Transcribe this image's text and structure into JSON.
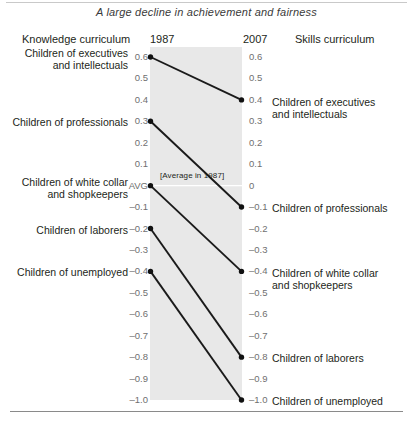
{
  "figure": {
    "title": "A large decline in achievement and fairness",
    "header": {
      "left_column": "Knowledge curriculum",
      "start_year": "1987",
      "end_year": "2007",
      "right_column": "Skills curriculum"
    },
    "annotation": "[Average in 1987]",
    "avg_tick_label": "AVG",
    "band_color": "#e8e8e8",
    "line_color": "#1a1a1a"
  },
  "axis": {
    "left_ticks": [
      "0.6",
      "0.5",
      "0.4",
      "0.3",
      "0.2",
      "0.1",
      "AVG",
      "–0.1",
      "–0.2",
      "–0.3",
      "–0.4",
      "–0.5",
      "–0.6",
      "–0.7",
      "–0.8",
      "–0.9",
      "–1.0"
    ],
    "right_ticks": [
      "0.6",
      "0.5",
      "0.4",
      "0.3",
      "0.2",
      "0.1",
      "0",
      "–0.1",
      "–0.2",
      "–0.3",
      "–0.4",
      "–0.5",
      "–0.6",
      "–0.7",
      "–0.8",
      "–0.9",
      "–1.0"
    ],
    "tick_values": [
      0.6,
      0.5,
      0.4,
      0.3,
      0.2,
      0.1,
      0,
      -0.1,
      -0.2,
      -0.3,
      -0.4,
      -0.5,
      -0.6,
      -0.7,
      -0.8,
      -0.9,
      -1.0
    ]
  },
  "chart_data": {
    "type": "line",
    "title": "A large decline in achievement and fairness",
    "xlabel": "",
    "ylabel": "",
    "x": [
      "1987",
      "2007"
    ],
    "ylim": [
      -1.0,
      0.6
    ],
    "grid": false,
    "legend": "inline-endpoint-labels",
    "series": [
      {
        "name": "Children of executives and intellectuals",
        "values": [
          0.6,
          0.4
        ],
        "start_label": "0.6",
        "end_label": "0.4"
      },
      {
        "name": "Children of professionals",
        "values": [
          0.3,
          -0.1
        ],
        "start_label": "0.3",
        "end_label": "–0.1"
      },
      {
        "name": "Children of white collar and shopkeepers",
        "values": [
          0.0,
          -0.4
        ],
        "start_label": "AVG",
        "end_label": "–0.4"
      },
      {
        "name": "Children of laborers",
        "values": [
          -0.2,
          -0.8
        ],
        "start_label": "–0.2",
        "end_label": "–0.8"
      },
      {
        "name": "Children of unemployed",
        "values": [
          -0.4,
          -1.0
        ],
        "start_label": "–0.4",
        "end_label": "–1.0"
      }
    ],
    "annotations": [
      {
        "text": "[Average in 1987]",
        "at_value": 0.0,
        "at_x": "1987"
      }
    ]
  },
  "left_labels": [
    {
      "line1": "Children of executives",
      "line2": "and intellectuals"
    },
    {
      "line1": "Children of professionals",
      "line2": ""
    },
    {
      "line1": "Children of white collar",
      "line2": "and shopkeepers"
    },
    {
      "line1": "Children of laborers",
      "line2": ""
    },
    {
      "line1": "Children of unemployed",
      "line2": ""
    }
  ],
  "right_labels": [
    {
      "line1": "Children of executives",
      "line2": "and intellectuals"
    },
    {
      "line1": "Children of professionals",
      "line2": ""
    },
    {
      "line1": "Children of white collar",
      "line2": "and shopkeepers"
    },
    {
      "line1": "Children of laborers",
      "line2": ""
    },
    {
      "line1": "Children of unemployed",
      "line2": ""
    }
  ]
}
